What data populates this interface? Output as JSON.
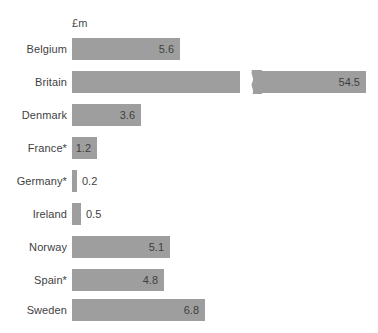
{
  "chart_data": {
    "type": "bar",
    "orientation": "horizontal",
    "title": "",
    "subtitle": "",
    "unit_label": "£m",
    "xlabel": "",
    "ylabel": "",
    "categories": [
      "Belgium",
      "Britain",
      "Denmark",
      "France*",
      "Germany*",
      "Ireland",
      "Norway",
      "Spain*",
      "Sweden"
    ],
    "values": [
      5.6,
      54.5,
      3.6,
      1.2,
      0.2,
      0.5,
      5.1,
      4.8,
      6.8
    ],
    "value_labels": [
      "5.6",
      "54.5",
      "3.6",
      "1.2",
      "0.2",
      "0.5",
      "5.1",
      "4.8",
      "6.8"
    ],
    "bar_color": "#9e9e9e",
    "text_color": "#3f3f3f",
    "background": "#ffffff",
    "grid": false,
    "legend": null,
    "axis_break": {
      "series": "Britain",
      "note": "bar truncated with zigzag break marker"
    },
    "footnote_marker": "*",
    "xlim": [
      0,
      7.6
    ]
  },
  "rows": [
    {
      "label": "Belgium",
      "value_label": "5.6",
      "bar_px": 108,
      "top": 38,
      "label_pos": "inside",
      "has_break": false
    },
    {
      "label": "Britain",
      "value_label": "54.5",
      "bar_px": 294,
      "top": 71,
      "label_pos": "inside",
      "has_break": true
    },
    {
      "label": "Denmark",
      "value_label": "3.6",
      "bar_px": 69,
      "top": 104,
      "label_pos": "inside",
      "has_break": false
    },
    {
      "label": "France*",
      "value_label": "1.2",
      "bar_px": 25,
      "top": 137,
      "label_pos": "inside",
      "has_break": false
    },
    {
      "label": "Germany*",
      "value_label": "0.2",
      "bar_px": 5,
      "top": 170,
      "label_pos": "outside",
      "has_break": false
    },
    {
      "label": "Ireland",
      "value_label": "0.5",
      "bar_px": 9,
      "top": 203,
      "label_pos": "outside",
      "has_break": false
    },
    {
      "label": "Norway",
      "value_label": "5.1",
      "bar_px": 98,
      "top": 236,
      "label_pos": "inside",
      "has_break": false
    },
    {
      "label": "Spain*",
      "value_label": "4.8",
      "bar_px": 92,
      "top": 269,
      "label_pos": "inside",
      "has_break": false
    },
    {
      "label": "Sweden",
      "value_label": "6.8",
      "bar_px": 133,
      "top": 299,
      "label_pos": "inside",
      "has_break": false
    }
  ]
}
